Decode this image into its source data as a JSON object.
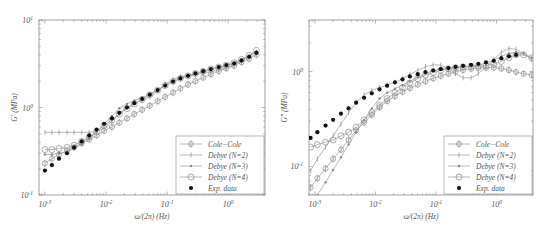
{
  "chart_data": [
    {
      "type": "line",
      "title": "",
      "xlabel": "ω/(2π) (Hz)",
      "ylabel": "G′ (MPa)",
      "xscale": "log",
      "yscale": "log",
      "xlim": [
        0.0008,
        4
      ],
      "ylim": [
        0.1,
        10
      ],
      "xticks": [
        "10^-3",
        "10^-2",
        "10^-1",
        "10^0"
      ],
      "yticks": [
        "10^-1",
        "10^0",
        "10^1"
      ],
      "grid": false,
      "legend_position": "lower right",
      "legend": [
        "Cole−Cole",
        "Debye (N=2)",
        "Debye (N=3)",
        "Debye (N=4)",
        "Exp. data"
      ],
      "x": [
        0.001,
        0.0013,
        0.0017,
        0.0023,
        0.003,
        0.004,
        0.0053,
        0.007,
        0.0093,
        0.0125,
        0.0165,
        0.022,
        0.029,
        0.039,
        0.052,
        0.07,
        0.093,
        0.125,
        0.165,
        0.22,
        0.29,
        0.39,
        0.52,
        0.7,
        0.93,
        1.25,
        1.65,
        2.2,
        2.9
      ],
      "series": [
        {
          "name": "Cole−Cole",
          "marker": "diamond-open",
          "values": [
            0.23,
            0.26,
            0.29,
            0.32,
            0.35,
            0.39,
            0.43,
            0.48,
            0.54,
            0.6,
            0.67,
            0.75,
            0.84,
            0.94,
            1.05,
            1.18,
            1.32,
            1.48,
            1.65,
            1.83,
            2.0,
            2.2,
            2.4,
            2.6,
            2.8,
            3.0,
            3.3,
            3.6,
            4.0
          ]
        },
        {
          "name": "Debye (N=2)",
          "marker": "plus",
          "values": [
            0.52,
            0.52,
            0.52,
            0.52,
            0.52,
            0.52,
            0.52,
            0.53,
            0.58,
            0.7,
            0.85,
            1.0,
            1.12,
            1.2,
            1.32,
            1.55,
            1.85,
            2.1,
            2.25,
            2.3,
            2.35,
            2.45,
            2.55,
            2.7,
            2.85,
            3.1,
            3.4,
            3.8,
            4.3
          ]
        },
        {
          "name": "Debye (N=3)",
          "marker": "asterisk",
          "values": [
            0.29,
            0.29,
            0.3,
            0.31,
            0.34,
            0.38,
            0.44,
            0.53,
            0.65,
            0.8,
            0.98,
            1.1,
            1.2,
            1.3,
            1.42,
            1.58,
            1.78,
            1.98,
            2.15,
            2.3,
            2.42,
            2.55,
            2.7,
            2.85,
            3.0,
            3.2,
            3.5,
            3.9,
            4.4
          ]
        },
        {
          "name": "Debye (N=4)",
          "marker": "circle-open",
          "values": [
            0.33,
            0.33,
            0.34,
            0.35,
            0.37,
            0.41,
            0.46,
            0.53,
            0.62,
            0.72,
            0.84,
            0.97,
            1.1,
            1.24,
            1.4,
            1.58,
            1.78,
            1.98,
            2.15,
            2.3,
            2.45,
            2.6,
            2.75,
            2.9,
            3.05,
            3.25,
            3.55,
            3.95,
            4.5
          ]
        },
        {
          "name": "Exp. data",
          "marker": "dot-filled",
          "values": [
            0.19,
            0.22,
            0.26,
            0.3,
            0.35,
            0.41,
            0.48,
            0.56,
            0.65,
            0.75,
            0.87,
            1.0,
            1.12,
            1.25,
            1.4,
            1.58,
            1.78,
            1.98,
            2.15,
            2.3,
            2.45,
            2.6,
            2.75,
            2.9,
            3.05,
            3.2,
            3.45,
            3.8,
            4.2
          ]
        }
      ]
    },
    {
      "type": "line",
      "title": "",
      "xlabel": "ω/(2π) (Hz)",
      "ylabel": "G″ (MPa)",
      "xscale": "log",
      "yscale": "log",
      "xlim": [
        0.0008,
        4
      ],
      "ylim": [
        0.05,
        3.5
      ],
      "xticks": [
        "10^-3",
        "10^-2",
        "10^-1",
        "10^0"
      ],
      "yticks": [
        "10^-1",
        "10^0"
      ],
      "grid": false,
      "legend_position": "lower right",
      "legend": [
        "Cole−Cole",
        "Debye (N=2)",
        "Debye (N=3)",
        "Debye (N=4)",
        "Exp. data"
      ],
      "x": [
        0.00085,
        0.0011,
        0.0015,
        0.002,
        0.0027,
        0.0036,
        0.0048,
        0.0065,
        0.0087,
        0.0117,
        0.0156,
        0.021,
        0.028,
        0.037,
        0.05,
        0.067,
        0.09,
        0.12,
        0.16,
        0.21,
        0.28,
        0.38,
        0.5,
        0.67,
        0.9,
        1.2,
        1.6,
        2.1,
        2.8,
        3.8
      ],
      "series": [
        {
          "name": "Cole−Cole",
          "marker": "diamond-open",
          "values": [
            0.06,
            0.075,
            0.095,
            0.12,
            0.15,
            0.19,
            0.24,
            0.29,
            0.35,
            0.42,
            0.49,
            0.55,
            0.61,
            0.67,
            0.73,
            0.79,
            0.85,
            0.9,
            0.95,
            1.0,
            1.04,
            1.07,
            1.09,
            1.1,
            1.1,
            1.08,
            1.04,
            0.99,
            0.95,
            0.92
          ]
        },
        {
          "name": "Debye (N=2)",
          "marker": "plus",
          "values": [
            0.09,
            0.12,
            0.16,
            0.21,
            0.28,
            0.37,
            0.47,
            0.57,
            0.63,
            0.68,
            0.72,
            0.77,
            0.84,
            0.93,
            1.03,
            1.12,
            1.18,
            1.17,
            1.08,
            0.95,
            0.86,
            0.86,
            0.95,
            1.12,
            1.35,
            1.6,
            1.75,
            1.72,
            1.55,
            1.35
          ]
        },
        {
          "name": "Debye (N=3)",
          "marker": "asterisk",
          "values": [
            0.038,
            0.05,
            0.068,
            0.092,
            0.125,
            0.17,
            0.23,
            0.31,
            0.41,
            0.52,
            0.6,
            0.66,
            0.72,
            0.79,
            0.87,
            0.95,
            1.02,
            1.07,
            1.1,
            1.12,
            1.13,
            1.14,
            1.17,
            1.23,
            1.33,
            1.45,
            1.55,
            1.6,
            1.55,
            1.4
          ]
        },
        {
          "name": "Debye (N=4)",
          "marker": "circle-open",
          "values": [
            0.16,
            0.17,
            0.18,
            0.19,
            0.21,
            0.23,
            0.26,
            0.31,
            0.37,
            0.44,
            0.52,
            0.6,
            0.68,
            0.76,
            0.84,
            0.92,
            0.98,
            1.03,
            1.07,
            1.1,
            1.12,
            1.13,
            1.14,
            1.16,
            1.2,
            1.28,
            1.4,
            1.5,
            1.5,
            1.4
          ]
        },
        {
          "name": "Exp. data",
          "marker": "dot-filled",
          "values": [
            0.2,
            0.23,
            0.27,
            0.31,
            0.36,
            0.41,
            0.47,
            0.53,
            0.59,
            0.65,
            0.71,
            0.77,
            0.83,
            0.89,
            0.94,
            0.99,
            1.03,
            1.06,
            1.09,
            1.12,
            1.15,
            1.18,
            1.21,
            1.25,
            1.3,
            1.38,
            1.45,
            1.5
          ]
        }
      ]
    }
  ],
  "panels": {
    "left": {
      "ylabel": "G′ (MPa)",
      "xlabel": "ω/(2π) (Hz)",
      "yticks": [
        {
          "base": "10",
          "exp": "1"
        },
        {
          "base": "10",
          "exp": "0"
        },
        {
          "base": "10",
          "exp": "-1"
        }
      ],
      "xticks": [
        {
          "base": "10",
          "exp": "-3"
        },
        {
          "base": "10",
          "exp": "-2"
        },
        {
          "base": "10",
          "exp": "-1"
        },
        {
          "base": "10",
          "exp": "0"
        }
      ]
    },
    "right": {
      "ylabel": "G″ (MPa)",
      "xlabel": "ω/(2π) (Hz)",
      "yticks": [
        {
          "base": "10",
          "exp": "0"
        },
        {
          "base": "10",
          "exp": "-1"
        }
      ],
      "xticks": [
        {
          "base": "10",
          "exp": "-3"
        },
        {
          "base": "10",
          "exp": "-2"
        },
        {
          "base": "10",
          "exp": "-1"
        },
        {
          "base": "10",
          "exp": "0"
        }
      ]
    }
  },
  "legend": {
    "items": [
      "Cole−Cole",
      "Debye (N=2)",
      "Debye (N=3)",
      "Debye (N=4)",
      "Exp. data"
    ]
  },
  "colors": {
    "axis": "#888888",
    "series_line": "#999999",
    "exp_marker": "#111111",
    "text": "#555555"
  }
}
